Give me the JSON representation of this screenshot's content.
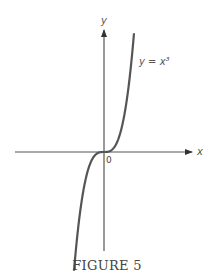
{
  "chart_data": {
    "type": "line",
    "title": "",
    "caption": "FIGURE 5",
    "xlabel": "x",
    "ylabel": "y",
    "origin_label": "0",
    "series": [
      {
        "name": "y = x³",
        "label": "y = x³",
        "function": "x^3",
        "x_range": [
          -1.6,
          1.6
        ]
      }
    ],
    "grid": false,
    "legend": "none"
  }
}
